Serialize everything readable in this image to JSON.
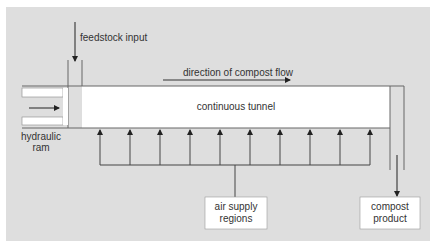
{
  "diagram": {
    "colors": {
      "background": "#ffffff",
      "panel": "#dedede",
      "tunnel": "#ffffff",
      "line": "#555555",
      "arrow": "#222222",
      "text": "#333333"
    },
    "labels": {
      "feedstock": "feedstock input",
      "direction": "direction of compost flow",
      "tunnel": "continuous tunnel",
      "ram_line1": "hydraulic",
      "ram_line2": "ram",
      "air_line1": "air supply",
      "air_line2": "regions",
      "product_line1": "compost",
      "product_line2": "product"
    },
    "components": [
      {
        "id": "feedstock-input",
        "label": "feedstock input"
      },
      {
        "id": "hydraulic-ram",
        "label": "hydraulic ram"
      },
      {
        "id": "continuous-tunnel",
        "label": "continuous tunnel"
      },
      {
        "id": "air-supply-regions",
        "label": "air supply regions",
        "air_inlets": 10
      },
      {
        "id": "compost-product",
        "label": "compost product"
      }
    ],
    "flows": [
      {
        "from": "feedstock-input",
        "to": "continuous-tunnel",
        "direction": "down"
      },
      {
        "from": "hydraulic-ram",
        "to": "continuous-tunnel",
        "direction": "right"
      },
      {
        "from": "air-supply-regions",
        "to": "continuous-tunnel",
        "direction": "up"
      },
      {
        "from": "continuous-tunnel",
        "to": "compost-product",
        "direction": "down"
      }
    ]
  }
}
